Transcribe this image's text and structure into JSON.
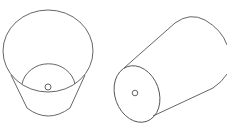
{
  "figures": [
    {
      "name": "upright-frustum-top-view",
      "description": "Cone frustum viewed from above with small hole in bottom"
    },
    {
      "name": "tilted-frustum-side-view",
      "description": "Cone frustum lying on its side with small hole in end face"
    }
  ],
  "colors": {
    "stroke": "#555555",
    "background": "#ffffff"
  }
}
